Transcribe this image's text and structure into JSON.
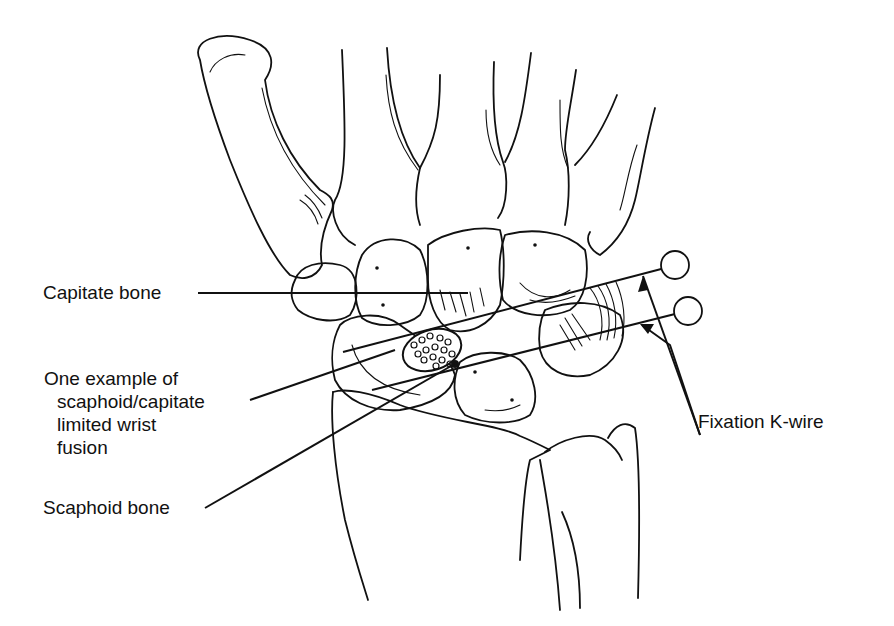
{
  "figure": {
    "background": "#ffffff",
    "ink_color": "#111111"
  },
  "labels": {
    "capitate": "Capitate bone",
    "fusion_line1": "One example of",
    "fusion_line2": "scaphoid/capitate",
    "fusion_line3": "limited wrist",
    "fusion_line4": "fusion",
    "scaphoid": "Scaphoid bone",
    "kwire": "Fixation K-wire"
  }
}
